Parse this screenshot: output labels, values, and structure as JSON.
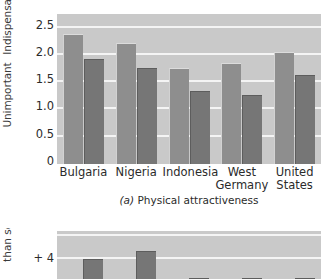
{
  "figure": {
    "panel_a": {
      "caption_letter": "(a)",
      "caption_text": "Physical attractiveness"
    },
    "panel_b": {
      "y_axis_partial_label": "than self"
    }
  },
  "chart_data": [
    {
      "type": "bar",
      "title": "(a) Physical attractiveness",
      "panel": "a",
      "xlabel": "",
      "ylabel": "Indispensable / Unimportant",
      "ylabel_top": "Indispensable",
      "ylabel_bottom": "Unimportant",
      "categories": [
        "Bulgaria",
        "Nigeria",
        "Indonesia",
        "West Germany",
        "United States"
      ],
      "category_lines": [
        [
          "Bulgaria"
        ],
        [
          "Nigeria"
        ],
        [
          "Indonesia"
        ],
        [
          "West",
          "Germany"
        ],
        [
          "United",
          "States"
        ]
      ],
      "ylim": [
        0,
        2.75
      ],
      "yticks": [
        0,
        0.5,
        1.0,
        1.5,
        2.0,
        2.5
      ],
      "ytick_labels": [
        "0",
        "0.5",
        "1.0",
        "1.5",
        "2.0",
        "2.5"
      ],
      "grid": true,
      "grid_axis": "y",
      "legend": "none",
      "series": [
        {
          "name": "series-1",
          "color": "#8e8e8e",
          "values": [
            2.38,
            2.22,
            1.76,
            1.86,
            2.05
          ]
        },
        {
          "name": "series-2",
          "color": "#767676",
          "values": [
            1.92,
            1.76,
            1.33,
            1.27,
            1.63
          ]
        }
      ]
    },
    {
      "type": "bar",
      "panel": "b",
      "cropped": true,
      "ylabel": "than self",
      "yticks": [
        2,
        4
      ],
      "ytick_labels": [
        "+ 2",
        "+ 4"
      ],
      "ylim": [
        0,
        5.2
      ],
      "grid": true,
      "grid_axis": "y",
      "legend": "none",
      "series": [
        {
          "name": "series-1",
          "color": "#767676",
          "values": [
            0,
            4.0,
            4.35,
            3.05,
            3.0,
            1.9
          ]
        }
      ]
    }
  ]
}
